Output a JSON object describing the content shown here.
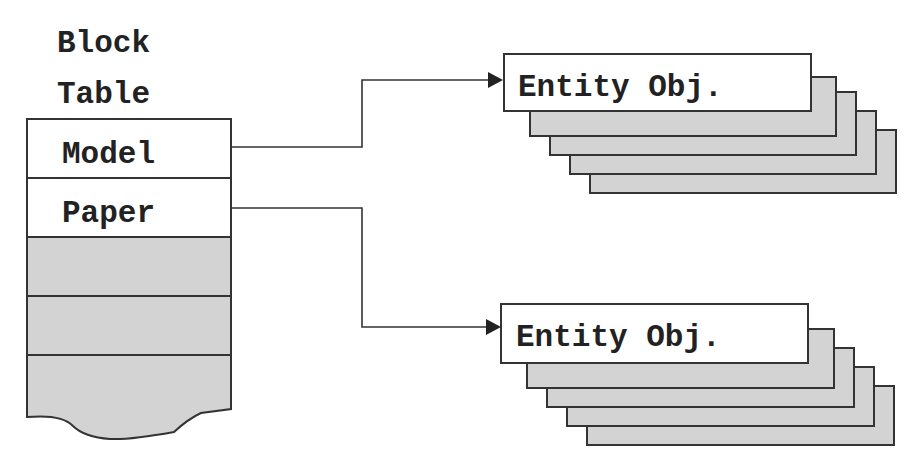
{
  "diagram": {
    "title_lines": [
      "Block",
      "Table"
    ],
    "block_table": {
      "rows": [
        {
          "label": "Model",
          "filled": false
        },
        {
          "label": "Paper",
          "filled": false
        },
        {
          "label": "",
          "filled": true
        },
        {
          "label": "",
          "filled": true
        },
        {
          "label": "",
          "filled": true
        }
      ]
    },
    "entity_stacks": [
      {
        "label": "Entity Obj.",
        "source": "Model",
        "stack_depth": 5
      },
      {
        "label": "Entity Obj.",
        "source": "Paper",
        "stack_depth": 5
      }
    ],
    "colors": {
      "stroke": "#333333",
      "fill_gray": "#d3d3d3",
      "fill_white": "#ffffff",
      "text": "#222222"
    }
  }
}
